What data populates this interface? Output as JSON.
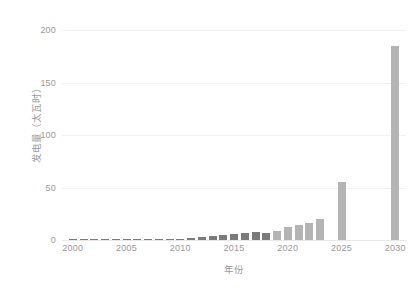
{
  "chart_data": {
    "type": "bar",
    "title": "",
    "xlabel": "年份",
    "ylabel": "发电量（太瓦时）",
    "xlim": [
      1999,
      2031
    ],
    "ylim": [
      0,
      200
    ],
    "yticks": [
      0,
      50,
      100,
      150,
      200
    ],
    "ytick_labels": [
      "0",
      "50",
      "100",
      "150",
      "200"
    ],
    "xticks": [
      2000,
      2005,
      2010,
      2015,
      2020,
      2025,
      2030
    ],
    "xtick_labels": [
      "2000",
      "2005",
      "2010",
      "2015",
      "2020",
      "2025",
      "2030"
    ],
    "grid": true,
    "legend": "none",
    "categories": [
      2000,
      2001,
      2002,
      2003,
      2004,
      2005,
      2006,
      2007,
      2008,
      2009,
      2010,
      2011,
      2012,
      2013,
      2014,
      2015,
      2016,
      2017,
      2018,
      2019,
      2020,
      2021,
      2022,
      2023,
      2025,
      2030
    ],
    "values": [
      0.2,
      0.2,
      0.2,
      0.2,
      0.3,
      0.3,
      0.3,
      0.4,
      0.4,
      0.5,
      0.8,
      1.6,
      2.6,
      3.4,
      5.2,
      5.6,
      7.0,
      8.0,
      6.8,
      8.2,
      12.0,
      14.5,
      16.5,
      20.0,
      55.0,
      185.0
    ],
    "series_colors": {
      "historical": "#7b7b7b",
      "projection": "#b4b4b4"
    },
    "projection_start_year": 2019,
    "grid_color": "#f2f2f2",
    "axis_text_color": "#9a9a9a",
    "background": "#ffffff"
  }
}
